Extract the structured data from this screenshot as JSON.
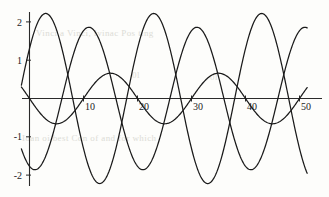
{
  "chart_data": {
    "type": "line",
    "title": "",
    "xlabel": "",
    "ylabel": "",
    "xlim": [
      -1.5,
      51.5
    ],
    "ylim": [
      -2.45,
      2.45
    ],
    "xticks": [
      10,
      20,
      30,
      40,
      50
    ],
    "yticks": [
      2,
      1,
      -1,
      -2
    ],
    "xtick_labels": [
      "10",
      "20",
      "30",
      "40",
      "50"
    ],
    "ytick_labels": [
      "2",
      "1",
      "-1",
      "-2"
    ],
    "grid": false,
    "legend": "none",
    "axis_style": "zero-crossing-spines",
    "line_color": "#1a1a1a",
    "background_color": "#fdfdfb",
    "series": [
      {
        "name": "curve-1",
        "amplitude": 2.22,
        "period": 20.0,
        "phase_deg": 36.0,
        "description": "large-amplitude sinusoid, first crest near x=3, zero near x=8"
      },
      {
        "name": "curve-2",
        "amplitude": 1.86,
        "period": 20.0,
        "phase_deg": -108.0,
        "description": "large-amplitude sinusoid, first crest near x=14, troughs near x=24"
      },
      {
        "name": "curve-3",
        "amplitude": 0.66,
        "period": 20.0,
        "phase_deg": 180.0,
        "description": "small-amplitude sinusoid, zero at x=10 and x=20, crest near x=15"
      }
    ]
  },
  "ghost_text": {
    "line1": "Vinci a Vinci, Ivinac Pos ting",
    "line2": "0l",
    "line3": "Ioan oi best Con of and for which",
    "line4": "0l"
  }
}
